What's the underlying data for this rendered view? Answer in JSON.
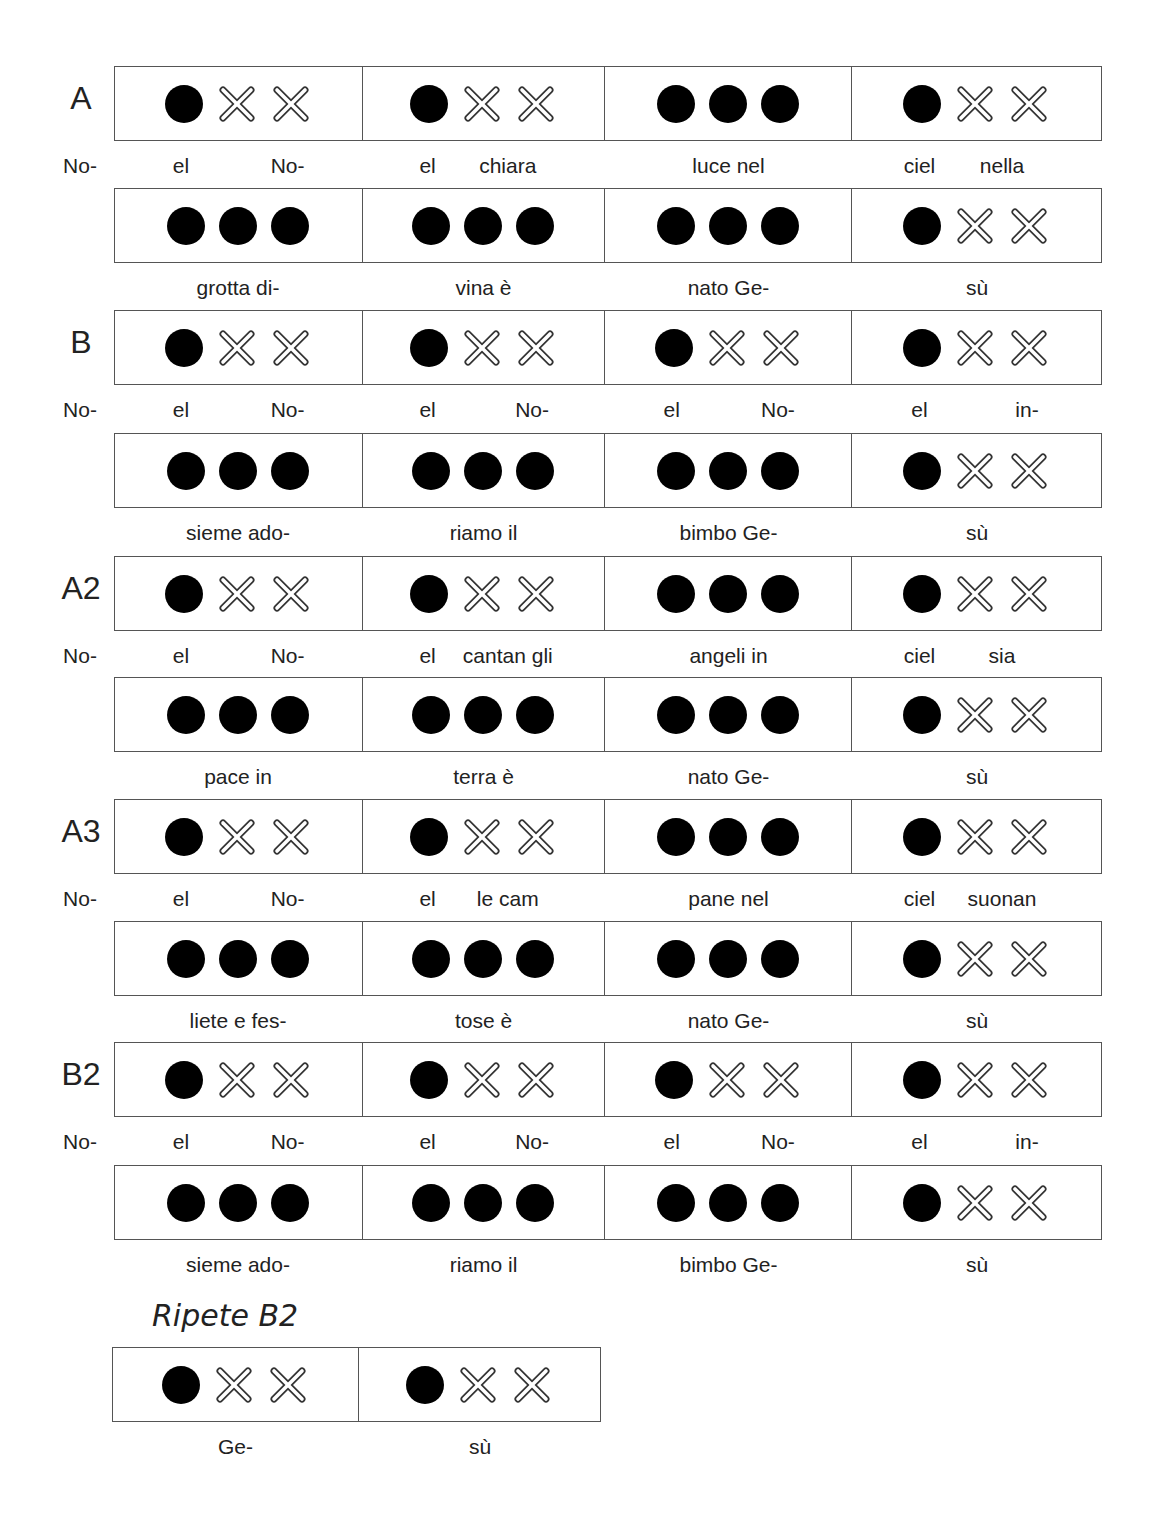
{
  "sections": [
    {
      "label": "A",
      "systems": [
        {
          "pickup": "No-",
          "cells": [
            {
              "pattern": [
                "dot",
                "x",
                "x"
              ],
              "lyrics": [
                "el",
                "",
                "No-"
              ]
            },
            {
              "pattern": [
                "dot",
                "x",
                "x"
              ],
              "lyrics": [
                "el",
                "chiara",
                ""
              ]
            },
            {
              "pattern": [
                "dot",
                "dot",
                "dot"
              ],
              "center": "luce nel"
            },
            {
              "pattern": [
                "dot",
                "x",
                "x"
              ],
              "lyrics": [
                "ciel",
                "nella",
                ""
              ]
            }
          ]
        },
        {
          "pickup": "",
          "cells": [
            {
              "pattern": [
                "dot",
                "dot",
                "dot"
              ],
              "center": "grotta di-"
            },
            {
              "pattern": [
                "dot",
                "dot",
                "dot"
              ],
              "center": "vina è"
            },
            {
              "pattern": [
                "dot",
                "dot",
                "dot"
              ],
              "center": "nato Ge-"
            },
            {
              "pattern": [
                "dot",
                "x",
                "x"
              ],
              "center": "sù"
            }
          ]
        }
      ]
    },
    {
      "label": "B",
      "systems": [
        {
          "pickup": "No-",
          "cells": [
            {
              "pattern": [
                "dot",
                "x",
                "x"
              ],
              "lyrics": [
                "el",
                "",
                "No-"
              ]
            },
            {
              "pattern": [
                "dot",
                "x",
                "x"
              ],
              "lyrics": [
                "el",
                "",
                "No-"
              ]
            },
            {
              "pattern": [
                "dot",
                "x",
                "x"
              ],
              "lyrics": [
                "el",
                "",
                "No-"
              ]
            },
            {
              "pattern": [
                "dot",
                "x",
                "x"
              ],
              "lyrics": [
                "el",
                "",
                "in-"
              ]
            }
          ]
        },
        {
          "pickup": "",
          "cells": [
            {
              "pattern": [
                "dot",
                "dot",
                "dot"
              ],
              "center": "sieme ado-"
            },
            {
              "pattern": [
                "dot",
                "dot",
                "dot"
              ],
              "center": "riamo il"
            },
            {
              "pattern": [
                "dot",
                "dot",
                "dot"
              ],
              "center": "bimbo Ge-"
            },
            {
              "pattern": [
                "dot",
                "x",
                "x"
              ],
              "center": "sù"
            }
          ]
        }
      ]
    },
    {
      "label": "A2",
      "systems": [
        {
          "pickup": "No-",
          "cells": [
            {
              "pattern": [
                "dot",
                "x",
                "x"
              ],
              "lyrics": [
                "el",
                "",
                "No-"
              ]
            },
            {
              "pattern": [
                "dot",
                "x",
                "x"
              ],
              "lyrics": [
                "el",
                "cantan gli",
                ""
              ]
            },
            {
              "pattern": [
                "dot",
                "dot",
                "dot"
              ],
              "center": "angeli in"
            },
            {
              "pattern": [
                "dot",
                "x",
                "x"
              ],
              "lyrics": [
                "ciel",
                "sia",
                ""
              ]
            }
          ]
        },
        {
          "pickup": "",
          "cells": [
            {
              "pattern": [
                "dot",
                "dot",
                "dot"
              ],
              "center": "pace in"
            },
            {
              "pattern": [
                "dot",
                "dot",
                "dot"
              ],
              "center": "terra è"
            },
            {
              "pattern": [
                "dot",
                "dot",
                "dot"
              ],
              "center": "nato Ge-"
            },
            {
              "pattern": [
                "dot",
                "x",
                "x"
              ],
              "center": "sù"
            }
          ]
        }
      ]
    },
    {
      "label": "A3",
      "systems": [
        {
          "pickup": "No-",
          "cells": [
            {
              "pattern": [
                "dot",
                "x",
                "x"
              ],
              "lyrics": [
                "el",
                "",
                "No-"
              ]
            },
            {
              "pattern": [
                "dot",
                "x",
                "x"
              ],
              "lyrics": [
                "el",
                "le cam",
                ""
              ]
            },
            {
              "pattern": [
                "dot",
                "dot",
                "dot"
              ],
              "center": "pane nel"
            },
            {
              "pattern": [
                "dot",
                "x",
                "x"
              ],
              "lyrics": [
                "ciel",
                "suonan",
                ""
              ]
            }
          ]
        },
        {
          "pickup": "",
          "cells": [
            {
              "pattern": [
                "dot",
                "dot",
                "dot"
              ],
              "center": "liete e fes-"
            },
            {
              "pattern": [
                "dot",
                "dot",
                "dot"
              ],
              "center": "tose è"
            },
            {
              "pattern": [
                "dot",
                "dot",
                "dot"
              ],
              "center": "nato Ge-"
            },
            {
              "pattern": [
                "dot",
                "x",
                "x"
              ],
              "center": "sù"
            }
          ]
        }
      ]
    },
    {
      "label": "B2",
      "systems": [
        {
          "pickup": "No-",
          "cells": [
            {
              "pattern": [
                "dot",
                "x",
                "x"
              ],
              "lyrics": [
                "el",
                "",
                "No-"
              ]
            },
            {
              "pattern": [
                "dot",
                "x",
                "x"
              ],
              "lyrics": [
                "el",
                "",
                "No-"
              ]
            },
            {
              "pattern": [
                "dot",
                "x",
                "x"
              ],
              "lyrics": [
                "el",
                "",
                "No-"
              ]
            },
            {
              "pattern": [
                "dot",
                "x",
                "x"
              ],
              "lyrics": [
                "el",
                "",
                "in-"
              ]
            }
          ]
        },
        {
          "pickup": "",
          "cells": [
            {
              "pattern": [
                "dot",
                "dot",
                "dot"
              ],
              "center": "sieme ado-"
            },
            {
              "pattern": [
                "dot",
                "dot",
                "dot"
              ],
              "center": "riamo il"
            },
            {
              "pattern": [
                "dot",
                "dot",
                "dot"
              ],
              "center": "bimbo Ge-"
            },
            {
              "pattern": [
                "dot",
                "x",
                "x"
              ],
              "center": "sù"
            }
          ]
        }
      ]
    }
  ],
  "repeat": {
    "title": "Ripete B2",
    "cells": [
      {
        "pattern": [
          "dot",
          "x",
          "x"
        ],
        "center": "Ge-"
      },
      {
        "pattern": [
          "dot",
          "x",
          "x"
        ],
        "center": "sù"
      }
    ]
  },
  "symbols": {
    "dot": "filled-circle-icon (beat played)",
    "x": "outlined-x-icon (rest)"
  }
}
